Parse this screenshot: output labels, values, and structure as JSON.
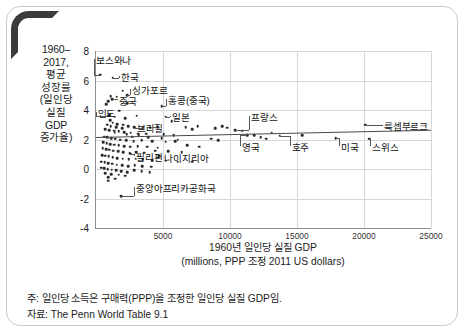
{
  "chart_data": {
    "type": "scatter",
    "title": "",
    "ylabel_lines": [
      "1960–",
      "2017,",
      "평균",
      "성장률",
      "(일인당",
      "실질",
      "GDP",
      "증가율)"
    ],
    "xlabel_lines": [
      "1960년 일인당 실질 GDP",
      "(millions, PPP 조정 2011 US dollars)"
    ],
    "xlim": [
      0,
      25000
    ],
    "ylim": [
      -4,
      8
    ],
    "grid": true,
    "legend": "none",
    "xticks": [
      5000,
      10000,
      15000,
      20000,
      25000
    ],
    "xtick_labels": [
      "5000",
      "10000",
      "15000",
      "20000",
      "25000"
    ],
    "yticks": [
      8,
      6,
      4,
      2,
      0,
      -2,
      -4
    ],
    "ytick_labels": [
      "8",
      "6",
      "4",
      "2",
      "0",
      "-2",
      "-4"
    ],
    "trendline": {
      "x0": 0,
      "y0": 2.15,
      "x1": 25000,
      "y1": 2.65
    },
    "annotations": [
      {
        "label": "보스와나",
        "lx": 5.5,
        "ly": 7.45,
        "px": 380,
        "py": 6.4
      },
      {
        "label": "한국",
        "lx": 1900,
        "ly": 6.3,
        "px": 1250,
        "py": 6.2
      },
      {
        "label": "싱가포르",
        "lx": 2700,
        "ly": 5.45,
        "px": 2350,
        "py": 5.0
      },
      {
        "label": "중국",
        "lx": 1750,
        "ly": 4.7,
        "px": 1200,
        "py": 4.75
      },
      {
        "label": "홍콩(중국)",
        "lx": 5400,
        "ly": 4.75,
        "px": 4900,
        "py": 4.25
      },
      {
        "label": "인도",
        "lx": 120,
        "ly": 3.85,
        "px": 900,
        "py": 3.6
      },
      {
        "label": "일본",
        "lx": 5700,
        "ly": 3.6,
        "px": 5200,
        "py": 3.55
      },
      {
        "label": "브라질",
        "lx": 3050,
        "ly": 2.85,
        "px": 3500,
        "py": 2.75
      },
      {
        "label": "프랑스",
        "lx": 11600,
        "ly": 3.6,
        "px": 10400,
        "py": 2.65
      },
      {
        "label": "영국",
        "lx": 10900,
        "ly": 1.55,
        "px": 11300,
        "py": 2.3
      },
      {
        "label": "호주",
        "lx": 14600,
        "ly": 1.55,
        "px": 13700,
        "py": 2.25
      },
      {
        "label": "미국",
        "lx": 18300,
        "ly": 1.55,
        "px": 17900,
        "py": 2.1
      },
      {
        "label": "스위스",
        "lx": 20600,
        "ly": 1.55,
        "px": 20400,
        "py": 2.05
      },
      {
        "label": "룩셉부르크",
        "lx": 21500,
        "ly": 2.95,
        "px": 20100,
        "py": 3.0
      },
      {
        "label": "필리핀",
        "lx": 3000,
        "ly": 0.85,
        "px": 2550,
        "py": 1.05
      },
      {
        "label": "나이지리아",
        "lx": 5100,
        "ly": 0.8,
        "px": 4700,
        "py": 0.85
      },
      {
        "label": "중앙아프리카공화국",
        "lx": 3000,
        "ly": -1.2,
        "px": 1900,
        "py": -1.85
      }
    ],
    "points": [
      [
        330,
        6.4
      ],
      [
        1250,
        6.2
      ],
      [
        2350,
        5.0
      ],
      [
        1980,
        5.3
      ],
      [
        1100,
        4.95
      ],
      [
        900,
        4.6
      ],
      [
        1200,
        4.75
      ],
      [
        1550,
        4.9
      ],
      [
        760,
        4.4
      ],
      [
        4900,
        4.25
      ],
      [
        2350,
        4.45
      ],
      [
        1750,
        3.95
      ],
      [
        980,
        3.65
      ],
      [
        900,
        3.6
      ],
      [
        1400,
        3.55
      ],
      [
        2200,
        3.45
      ],
      [
        3050,
        3.6
      ],
      [
        5200,
        3.55
      ],
      [
        5650,
        3.25
      ],
      [
        1050,
        3.3
      ],
      [
        1250,
        3.15
      ],
      [
        1600,
        3.05
      ],
      [
        2050,
        3.0
      ],
      [
        820,
        3.0
      ],
      [
        1100,
        2.9
      ],
      [
        1500,
        2.85
      ],
      [
        1950,
        2.75
      ],
      [
        2400,
        2.9
      ],
      [
        2850,
        2.85
      ],
      [
        3500,
        2.75
      ],
      [
        4050,
        2.8
      ],
      [
        4600,
        2.85
      ],
      [
        700,
        2.7
      ],
      [
        980,
        2.65
      ],
      [
        1350,
        2.6
      ],
      [
        1700,
        2.55
      ],
      [
        2100,
        2.5
      ],
      [
        2600,
        2.45
      ],
      [
        3150,
        2.4
      ],
      [
        3750,
        2.4
      ],
      [
        5050,
        2.35
      ],
      [
        5800,
        2.3
      ],
      [
        6700,
        2.85
      ],
      [
        7200,
        2.7
      ],
      [
        7600,
        2.9
      ],
      [
        8900,
        2.75
      ],
      [
        9400,
        2.9
      ],
      [
        9800,
        2.8
      ],
      [
        10400,
        2.65
      ],
      [
        10900,
        2.6
      ],
      [
        11300,
        2.3
      ],
      [
        11800,
        2.3
      ],
      [
        12300,
        2.15
      ],
      [
        12700,
        2.05
      ],
      [
        13100,
        2.45
      ],
      [
        13700,
        2.25
      ],
      [
        15400,
        2.3
      ],
      [
        17900,
        2.1
      ],
      [
        20100,
        3.0
      ],
      [
        20400,
        2.05
      ],
      [
        600,
        2.2
      ],
      [
        850,
        2.15
      ],
      [
        1150,
        2.1
      ],
      [
        1450,
        2.05
      ],
      [
        1800,
        2.0
      ],
      [
        2250,
        1.95
      ],
      [
        2800,
        1.9
      ],
      [
        3400,
        1.95
      ],
      [
        4200,
        1.9
      ],
      [
        5200,
        1.85
      ],
      [
        6100,
        2.0
      ],
      [
        550,
        1.8
      ],
      [
        800,
        1.75
      ],
      [
        1050,
        1.7
      ],
      [
        1350,
        1.65
      ],
      [
        1700,
        1.6
      ],
      [
        2100,
        1.55
      ],
      [
        2550,
        1.5
      ],
      [
        3100,
        1.55
      ],
      [
        3800,
        1.5
      ],
      [
        4600,
        1.45
      ],
      [
        500,
        1.4
      ],
      [
        750,
        1.35
      ],
      [
        1000,
        1.3
      ],
      [
        1300,
        1.25
      ],
      [
        1650,
        1.2
      ],
      [
        2050,
        1.15
      ],
      [
        2500,
        1.1
      ],
      [
        3000,
        1.15
      ],
      [
        3600,
        1.1
      ],
      [
        2550,
        1.05
      ],
      [
        4700,
        0.85
      ],
      [
        450,
        0.95
      ],
      [
        700,
        0.9
      ],
      [
        950,
        0.85
      ],
      [
        1250,
        0.8
      ],
      [
        1600,
        0.75
      ],
      [
        2000,
        0.7
      ],
      [
        2450,
        0.65
      ],
      [
        2950,
        0.7
      ],
      [
        3500,
        0.65
      ],
      [
        4200,
        0.6
      ],
      [
        5200,
        0.55
      ],
      [
        6100,
        0.5
      ],
      [
        400,
        0.5
      ],
      [
        650,
        0.45
      ],
      [
        900,
        0.4
      ],
      [
        1200,
        0.35
      ],
      [
        1550,
        0.3
      ],
      [
        1950,
        0.25
      ],
      [
        2400,
        0.2
      ],
      [
        2900,
        0.25
      ],
      [
        3450,
        0.2
      ],
      [
        4100,
        0.15
      ],
      [
        7200,
        0.5
      ],
      [
        380,
        0.1
      ],
      [
        620,
        0.05
      ],
      [
        880,
        0.0
      ],
      [
        1180,
        -0.05
      ],
      [
        1520,
        -0.1
      ],
      [
        1900,
        -0.15
      ],
      [
        2350,
        -0.2
      ],
      [
        2850,
        -0.1
      ],
      [
        3400,
        -0.15
      ],
      [
        4000,
        -0.2
      ],
      [
        900,
        -0.55
      ],
      [
        900,
        -0.8
      ],
      [
        1450,
        -0.65
      ],
      [
        1900,
        -1.85
      ],
      [
        1700,
        -0.4
      ],
      [
        2200,
        -0.45
      ],
      [
        1150,
        -0.35
      ],
      [
        700,
        -0.3
      ],
      [
        1400,
        2.45
      ],
      [
        2700,
        2.2
      ],
      [
        3900,
        2.15
      ],
      [
        4900,
        2.1
      ],
      [
        5900,
        1.9
      ],
      [
        6800,
        1.6
      ],
      [
        7700,
        1.5
      ],
      [
        8600,
        2.05
      ],
      [
        9100,
        1.95
      ],
      [
        4400,
        1.25
      ],
      [
        5400,
        1.2
      ],
      [
        6400,
        1.15
      ],
      [
        3200,
        2.3
      ],
      [
        2300,
        2.35
      ]
    ]
  },
  "notes": {
    "note_line": "주: 일인당 소득은 구매력(PPP)을 조정한 일인당 실질 GDP임.",
    "source_line": "자료: The Penn World Table 9.1"
  }
}
